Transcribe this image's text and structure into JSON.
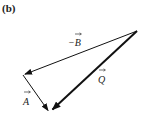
{
  "figure": {
    "panel_label": "(b)",
    "vectors": [
      {
        "name": "neg-B",
        "label": "−B",
        "from": [
          137,
          31
        ],
        "to": [
          23,
          75
        ],
        "weight": "thin"
      },
      {
        "name": "A",
        "label": "A",
        "from": [
          23,
          75
        ],
        "to": [
          49,
          112
        ],
        "weight": "thin"
      },
      {
        "name": "Q",
        "label": "Q",
        "from": [
          137,
          31
        ],
        "to": [
          51,
          111
        ],
        "weight": "thick"
      }
    ],
    "labels": {
      "neg_B": "−B",
      "A": "A",
      "Q": "Q"
    },
    "colors": {
      "line": "#111111",
      "background": "#ffffff"
    }
  }
}
